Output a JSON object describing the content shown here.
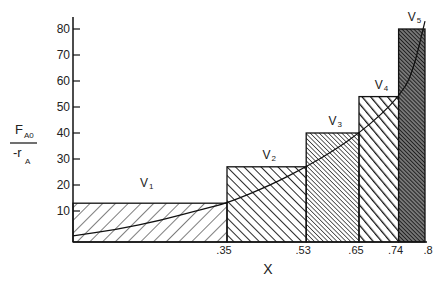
{
  "chart_data": {
    "type": "bar",
    "title": "",
    "xlabel": "X",
    "ylabel": "F_A0 / -r_A",
    "ylabel_parts": {
      "numerator": "F",
      "numerator_sub": "A0",
      "denominator": "-r",
      "denominator_sub": "A"
    },
    "ylim": [
      0,
      80
    ],
    "xlim": [
      0,
      0.8
    ],
    "yticks": [
      10,
      20,
      30,
      40,
      50,
      60,
      70,
      80
    ],
    "ytick_labels": [
      "10",
      "20",
      "30",
      "40",
      "50",
      "60",
      "70",
      "80"
    ],
    "xticks": [
      0.35,
      0.53,
      0.65,
      0.74,
      0.8
    ],
    "xtick_labels": [
      ".35",
      ".53",
      ".65",
      ".74",
      ".8"
    ],
    "grid": false,
    "bars": [
      {
        "label": "V",
        "sub": "1",
        "x_start": 0.0,
        "x_end": 0.35,
        "height": 13,
        "hatch": "backslash-wide"
      },
      {
        "label": "V",
        "sub": "2",
        "x_start": 0.35,
        "x_end": 0.53,
        "height": 27,
        "hatch": "slash-medium"
      },
      {
        "label": "V",
        "sub": "3",
        "x_start": 0.53,
        "x_end": 0.65,
        "height": 40,
        "hatch": "backslash-fine"
      },
      {
        "label": "V",
        "sub": "4",
        "x_start": 0.65,
        "x_end": 0.74,
        "height": 54,
        "hatch": "slash-bold"
      },
      {
        "label": "V",
        "sub": "5",
        "x_start": 0.74,
        "x_end": 0.8,
        "height": 80,
        "hatch": "dense-dark"
      }
    ],
    "curve": {
      "name": "F_A0/-r_A vs X",
      "x": [
        0.0,
        0.1,
        0.2,
        0.3,
        0.35,
        0.45,
        0.53,
        0.6,
        0.65,
        0.7,
        0.74,
        0.77,
        0.8
      ],
      "y": [
        2,
        4,
        7,
        11,
        13,
        20,
        27,
        34,
        40,
        47,
        54,
        62,
        83
      ]
    }
  }
}
